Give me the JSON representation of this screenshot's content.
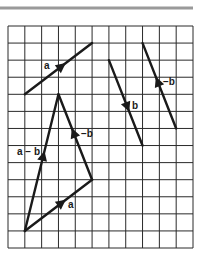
{
  "figure": {
    "width": 202,
    "height": 262,
    "colors": {
      "ink": "#1a1a1a",
      "grid": "#2a2a2a",
      "rule": "#9a9a9a",
      "background": "#ffffff"
    },
    "top_rule": {
      "x1": 0,
      "x2": 193,
      "y": 8
    },
    "grid": {
      "left": 8,
      "top": 26,
      "right": 193,
      "bottom": 248,
      "cols": 11,
      "rows": 13
    },
    "vectors": [
      {
        "id": "a-top",
        "name": "a",
        "from": [
          1,
          4
        ],
        "to": [
          5,
          1
        ],
        "arrow_t": 0.55,
        "label": "a",
        "label_pos": [
          44,
          69
        ]
      },
      {
        "id": "b",
        "name": "b",
        "from": [
          6,
          2
        ],
        "to": [
          8,
          7
        ],
        "arrow_t": 0.55,
        "label": "b",
        "label_pos": [
          132,
          109
        ]
      },
      {
        "id": "neg-b-top",
        "name": "-b",
        "from": [
          10,
          6
        ],
        "to": [
          8,
          1
        ],
        "arrow_t": 0.55,
        "label": "−b",
        "label_pos": [
          163,
          85
        ]
      },
      {
        "id": "a-bottom",
        "name": "a",
        "from": [
          1,
          12
        ],
        "to": [
          5,
          9
        ],
        "arrow_t": 0.55,
        "label": "a",
        "label_pos": [
          68,
          208
        ]
      },
      {
        "id": "neg-b-triangle",
        "name": "-b",
        "from": [
          5,
          9
        ],
        "to": [
          3,
          4
        ],
        "arrow_t": 0.55,
        "label": "−b",
        "label_pos": [
          81,
          137
        ]
      },
      {
        "id": "a-minus-b",
        "name": "a-b",
        "from": [
          1,
          12
        ],
        "to": [
          3,
          4
        ],
        "arrow_t": 0.55,
        "label": "a − b",
        "label_pos": [
          17,
          155
        ]
      }
    ]
  }
}
